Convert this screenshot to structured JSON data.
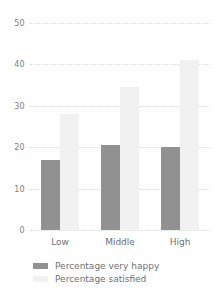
{
  "chart_data": {
    "type": "bar",
    "title": "",
    "subtitle": "",
    "xlabel": "",
    "ylabel": "",
    "categories": [
      "Low",
      "Middle",
      "High"
    ],
    "series": [
      {
        "name": "Percentage very happy",
        "color": "#919191",
        "values": [
          17,
          20.5,
          20
        ]
      },
      {
        "name": "Percentage satisfied",
        "color": "#f1f1f1",
        "values": [
          28,
          34.5,
          41
        ]
      }
    ],
    "ylim": [
      0,
      50
    ],
    "yticks": [
      0,
      10,
      20,
      30,
      40,
      50
    ],
    "ytick_labels": [
      "0",
      "10",
      "20",
      "30",
      "40",
      "50"
    ],
    "grid": true,
    "grid_style": "dotted",
    "grid_color": "#dedede",
    "legend_position": "bottom-left",
    "axis_line": false,
    "background": "#ffffff"
  }
}
